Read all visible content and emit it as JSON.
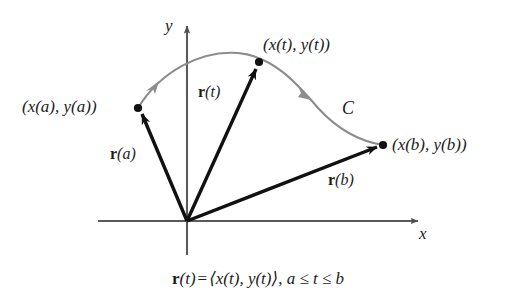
{
  "figure": {
    "title_equation": {
      "vector_name": "r",
      "arg": "(t)",
      "equals": "=",
      "components": "⟨x(t), y(t)⟩",
      "separator": ",",
      "domain": "a ≤ t ≤ b",
      "full": "r(t) = ⟨x(t), y(t)⟩, a ≤ t ≤ b"
    },
    "axes": {
      "x_label": "x",
      "y_label": "y",
      "origin": [
        187,
        221
      ],
      "x_axis_end": [
        420,
        221
      ],
      "y_axis_top": [
        187,
        22
      ],
      "color": "#5a5a5a"
    },
    "curve": {
      "name_label": "C",
      "color": "#8c8c8c",
      "direction": "from (x(a), y(a)) to (x(b), y(b))",
      "arrow_count": 2
    },
    "points": [
      {
        "id": "start",
        "label": "(x(a), y(a))",
        "x": 138,
        "y": 108,
        "label_x": 22,
        "label_y": 98
      },
      {
        "id": "param",
        "label": "(x(t), y(t))",
        "x": 259,
        "y": 62,
        "label_x": 263,
        "label_y": 36
      },
      {
        "id": "end",
        "label": "(x(b), y(b))",
        "x": 383,
        "y": 145,
        "label_x": 392,
        "label_y": 136
      }
    ],
    "vectors": [
      {
        "id": "r-a",
        "name": "r",
        "arg": "(a)",
        "label": "r(a)",
        "to_point": "start",
        "label_x": 110,
        "label_y": 146
      },
      {
        "id": "r-t",
        "name": "r",
        "arg": "(t)",
        "label": "r(t)",
        "to_point": "param",
        "label_x": 198,
        "label_y": 84
      },
      {
        "id": "r-b",
        "name": "r",
        "arg": "(b)",
        "label": "r(b)",
        "to_point": "end",
        "label_x": 328,
        "label_y": 172
      }
    ],
    "colors": {
      "background": "#ffffff",
      "ink": "#1c1c1c",
      "axis": "#5a5a5a",
      "curve": "#8c8c8c",
      "vector": "#111111"
    }
  }
}
